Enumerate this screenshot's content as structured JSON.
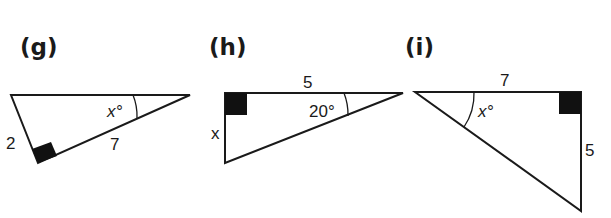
{
  "figures": [
    {
      "id": "g",
      "label": "(g)",
      "sides": {
        "hypotenuse": "",
        "short_leg": "2",
        "long_leg": "7"
      },
      "angle_label": "x°",
      "right_angle": "bottom vertex"
    },
    {
      "id": "h",
      "label": "(h)",
      "sides": {
        "top": "5",
        "left": "x"
      },
      "angle_label": "20°",
      "right_angle": "top-left vertex"
    },
    {
      "id": "i",
      "label": "(i)",
      "sides": {
        "top": "7",
        "right": "5"
      },
      "angle_label": "x°",
      "right_angle": "top-right vertex"
    }
  ],
  "colors": {
    "ink": "#1a1a1a",
    "background": "#ffffff"
  }
}
